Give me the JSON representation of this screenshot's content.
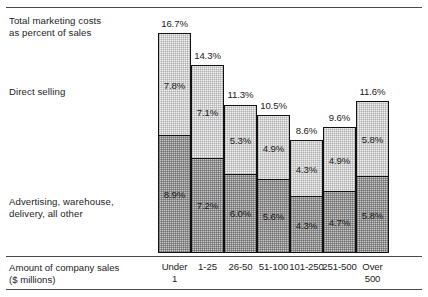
{
  "rules": {
    "top": "",
    "axis": "",
    "bottom": ""
  },
  "labels": {
    "total": "Total marketing costs\nas percent of sales",
    "direct_selling": "Direct selling",
    "advertising": "Advertising, warehouse,\ndelivery, all other",
    "axis_caption": "Amount of company sales\n($ millions)"
  },
  "colors": {
    "segment_top_fill": "#f2f2f2",
    "segment_bottom_fill": "#c8c8c8",
    "outline": "#111111",
    "rule": "#4a4a4a",
    "text": "#1d1d1d"
  },
  "chart_data": {
    "type": "bar",
    "title": "Total marketing costs as percent of sales",
    "xlabel": "Amount of company sales ($ millions)",
    "ylabel": "Percent of sales",
    "stacked": true,
    "grid": false,
    "legend_position": "left-labels",
    "ylim": [
      0,
      16.7
    ],
    "categories": [
      "Under\n1",
      "1-25",
      "26-50",
      "51-100",
      "101-250",
      "251-500",
      "Over\n500"
    ],
    "series": [
      {
        "name": "Direct selling",
        "values": [
          7.8,
          7.1,
          5.3,
          4.9,
          4.3,
          4.9,
          5.8
        ],
        "value_labels": [
          "7.8%",
          "7.1%",
          "5.3%",
          "4.9%",
          "4.3%",
          "4.9%",
          "5.8%"
        ]
      },
      {
        "name": "Advertising, warehouse, delivery, all other",
        "values": [
          8.9,
          7.2,
          6.0,
          5.6,
          4.3,
          4.7,
          5.8
        ],
        "value_labels": [
          "8.9%",
          "7.2%",
          "6.0%",
          "5.6%",
          "4.3%",
          "4.7%",
          "5.8%"
        ]
      }
    ],
    "totals": [
      16.7,
      14.3,
      11.3,
      10.5,
      8.6,
      9.6,
      11.6
    ],
    "total_labels": [
      "16.7%",
      "14.3%",
      "11.3%",
      "10.5%",
      "8.6%",
      "9.6%",
      "11.6%"
    ]
  }
}
